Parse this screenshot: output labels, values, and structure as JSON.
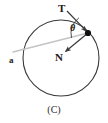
{
  "figure": {
    "caption": "(C)",
    "background_color": "#ffffff",
    "stroke_color": "#3a3a3a",
    "accent_color": "#bfbfbf",
    "point_color": "#111111",
    "labels": {
      "tangent": "T",
      "normal": "N",
      "angle": "θ",
      "acceleration": "a"
    },
    "circle": {
      "center_x": 61,
      "center_y": 58,
      "radius": 38
    },
    "point_on_circle": {
      "x": 88,
      "y": 33
    },
    "vectors": [
      {
        "name": "tangent-vector",
        "label": "T",
        "from_x": 88,
        "from_y": 33,
        "to_x": 67,
        "to_y": 11,
        "color": "#3a3a3a"
      },
      {
        "name": "normal-vector",
        "label": "N",
        "from_x": 88,
        "from_y": 33,
        "to_x": 64,
        "to_y": 53,
        "color": "#3a3a3a"
      },
      {
        "name": "acceleration-vector",
        "label": "a",
        "from_x": 88,
        "from_y": 33,
        "to_x": 13,
        "to_y": 52,
        "color": "#c4c4c4"
      }
    ],
    "angle_arc": {
      "name": "theta-arc",
      "vertex_x": 88,
      "vertex_y": 33,
      "radius": 19,
      "between": [
        "a",
        "T"
      ]
    }
  }
}
